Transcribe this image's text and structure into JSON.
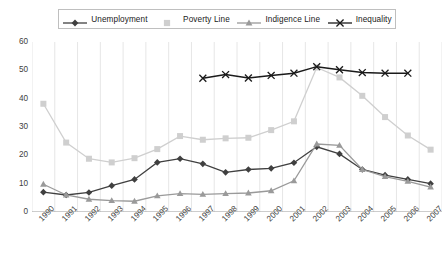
{
  "chart_data": {
    "type": "line",
    "title": "",
    "xlabel": "",
    "ylabel": "",
    "ylim": [
      0,
      60
    ],
    "ytick_step": 10,
    "yticks": [
      0,
      10,
      20,
      30,
      40,
      50,
      60
    ],
    "grid": "vertical",
    "legend_position": "top",
    "categories": [
      "1990",
      "1991",
      "1992",
      "1993",
      "1994",
      "1995",
      "1996",
      "1997",
      "1998",
      "1999",
      "2000",
      "2001",
      "2002",
      "2003",
      "2004",
      "2005",
      "2006",
      "2007"
    ],
    "series": [
      {
        "name": "Unemployment",
        "marker": "diamond",
        "color": "#404040",
        "values": [
          7.0,
          6.0,
          6.9,
          9.3,
          11.5,
          17.5,
          18.8,
          17.0,
          14.0,
          15.0,
          15.4,
          17.4,
          23.0,
          20.5,
          15.0,
          13.0,
          11.5,
          10.0
        ]
      },
      {
        "name": "Poverty Line",
        "marker": "square",
        "color": "#cfcfcf",
        "values": [
          38.2,
          24.5,
          18.8,
          17.5,
          19.0,
          22.2,
          26.8,
          25.5,
          26.0,
          26.2,
          28.9,
          32.0,
          51.0,
          47.5,
          41.0,
          33.5,
          27.0,
          22.0
        ]
      },
      {
        "name": "Indigence Line",
        "marker": "triangle",
        "color": "#9a9a9a",
        "values": [
          9.8,
          6.0,
          4.5,
          4.0,
          3.8,
          5.7,
          6.5,
          6.2,
          6.5,
          6.7,
          7.5,
          11.0,
          24.0,
          23.5,
          15.0,
          12.5,
          10.8,
          8.8
        ]
      },
      {
        "name": "Inequality",
        "marker": "cross",
        "color": "#1a1a1a",
        "values": [
          null,
          null,
          null,
          null,
          null,
          null,
          null,
          47.2,
          48.5,
          47.3,
          48.2,
          49.0,
          51.3,
          50.2,
          49.2,
          49.0,
          49.0,
          null
        ]
      }
    ]
  },
  "legend": {
    "items": [
      {
        "label": "Unemployment",
        "marker": "diamond",
        "color": "#404040"
      },
      {
        "label": "Poverty Line",
        "marker": "square",
        "color": "#cfcfcf"
      },
      {
        "label": "Indigence Line",
        "marker": "triangle",
        "color": "#9a9a9a"
      },
      {
        "label": "Inequality",
        "marker": "cross",
        "color": "#1a1a1a"
      }
    ]
  }
}
